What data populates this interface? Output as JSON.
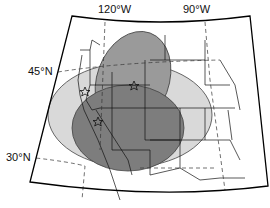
{
  "map": {
    "labels": {
      "lon_120": "120°W",
      "lon_90": "90°W",
      "lat_45": "45°N",
      "lat_30": "30°N"
    },
    "colors": {
      "outer_region": "#d9d9d9",
      "middle_region": "#8f8f8f",
      "inner_region": "#7a7a7a",
      "boundary": "#000000",
      "background": "#ffffff"
    },
    "markers": [
      {
        "type": "star",
        "name": "star-oregon"
      },
      {
        "type": "star",
        "name": "star-idaho"
      },
      {
        "type": "star",
        "name": "star-nevada"
      }
    ]
  }
}
